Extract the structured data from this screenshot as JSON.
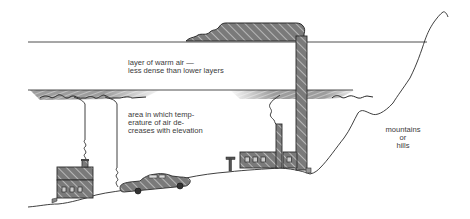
{
  "diagram": {
    "labels": {
      "warm_layer_line1": "layer of warm air —",
      "warm_layer_line2": "less dense than lower layers",
      "cool_area_line1": "area in which temp-",
      "cool_area_line2": "erature of air de-",
      "cool_area_line3": "creases with elevation",
      "mountains_line1": "mountains",
      "mountains_line2": "or",
      "mountains_line3": "hills"
    },
    "elements": [
      {
        "name": "upper-boundary-line",
        "desc": "top of warm air layer"
      },
      {
        "name": "lower-boundary-line",
        "desc": "bottom of warm air layer with trapped smog"
      },
      {
        "name": "house",
        "desc": "house with chimney smoke rising"
      },
      {
        "name": "car",
        "desc": "car with exhaust rising"
      },
      {
        "name": "factory",
        "desc": "factory with short and tall smokestacks"
      },
      {
        "name": "mountain-outline",
        "desc": "mountains or hills on right"
      },
      {
        "name": "smoke-plume",
        "desc": "smoke from tall stack spreading above warm layer"
      }
    ],
    "colors": {
      "ink": "#2a2a2a",
      "fill_dark": "#6e6e6e",
      "fill_mid": "#9a9a9a",
      "text": "#3a3a3a"
    }
  }
}
